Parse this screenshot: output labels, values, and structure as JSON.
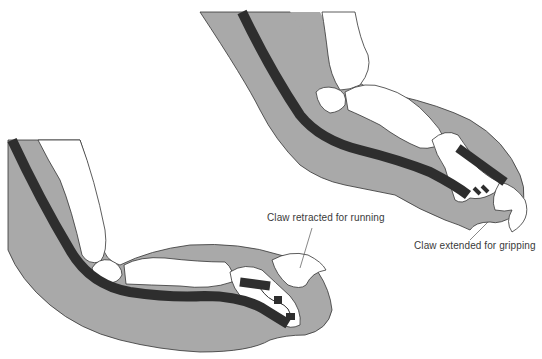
{
  "diagram": {
    "labels": {
      "retracted": "Claw retracted for running",
      "extended": "Claw extended for gripping"
    },
    "colors": {
      "flesh": "#a9a9a9",
      "tendon": "#2e2e2e",
      "bone": "#ffffff",
      "outline": "#333333",
      "label_text": "#3a3a3a"
    },
    "figures": [
      {
        "name": "retracted-paw",
        "state": "retracted"
      },
      {
        "name": "extended-paw",
        "state": "extended"
      }
    ]
  }
}
